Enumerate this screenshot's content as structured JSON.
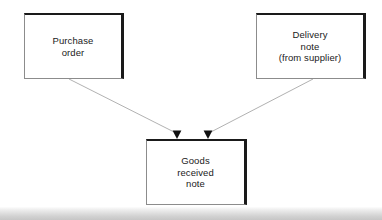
{
  "diagram": {
    "background_color": "#ffffff",
    "nodes": [
      {
        "id": "purchase-order",
        "label": "Purchase\norder",
        "x": 24,
        "y": 13,
        "width": 100,
        "height": 66
      },
      {
        "id": "delivery-note",
        "label": "Delivery\nnote\n(from  supplier)",
        "x": 256,
        "y": 13,
        "width": 110,
        "height": 66
      },
      {
        "id": "goods-received-note",
        "label": "Goods\nreceived\nnote",
        "x": 146,
        "y": 139,
        "width": 101,
        "height": 66
      }
    ],
    "connectors": [
      {
        "id": "purchase-order-to-goods-received-note",
        "from": "purchase-order",
        "to": "goods-received-note",
        "x1": 69,
        "y1": 79,
        "x2": 177,
        "y2": 132,
        "arrowhead": "filled-triangle",
        "line_color": "#a8a8a8"
      },
      {
        "id": "delivery-note-to-goods-received-note",
        "from": "delivery-note",
        "to": "goods-received-note",
        "x1": 313,
        "y1": 79,
        "x2": 208,
        "y2": 132,
        "arrowhead": "filled-triangle",
        "line_color": "#a8a8a8"
      }
    ],
    "colors": {
      "box_fill": "#ffffff",
      "box_border_dark": "#1a1a1a",
      "box_border_light": "#8c8c8c",
      "text": "#1a1a1a",
      "connector": "#a8a8a8",
      "arrowhead": "#111111",
      "bottom_bar_light": "#fdfdfd",
      "bottom_bar_dark": "#c6c6c6"
    },
    "bottom_bar": {
      "label": "page-edge-strip",
      "y": 207,
      "height": 13
    }
  }
}
